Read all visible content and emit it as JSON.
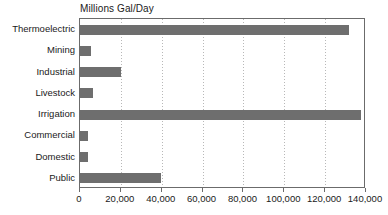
{
  "chart_data": {
    "type": "bar",
    "orientation": "horizontal",
    "title": "Millions Gal/Day",
    "xlabel": "",
    "ylabel": "",
    "xlim": [
      0,
      140000
    ],
    "xticks": [
      0,
      20000,
      40000,
      60000,
      80000,
      100000,
      120000,
      140000
    ],
    "xtick_labels": [
      "0",
      "20,000",
      "40,000",
      "60,000",
      "80,000",
      "100,000",
      "120,000",
      "140,000"
    ],
    "grid": "vertical-dotted",
    "legend": "none",
    "bar_color": "#6e6e6e",
    "categories": [
      "Thermoelectric",
      "Mining",
      "Industrial",
      "Livestock",
      "Irrigation",
      "Commercial",
      "Domestic",
      "Public"
    ],
    "values": [
      131500,
      5400,
      20000,
      6400,
      137500,
      3700,
      4000,
      39500
    ]
  }
}
